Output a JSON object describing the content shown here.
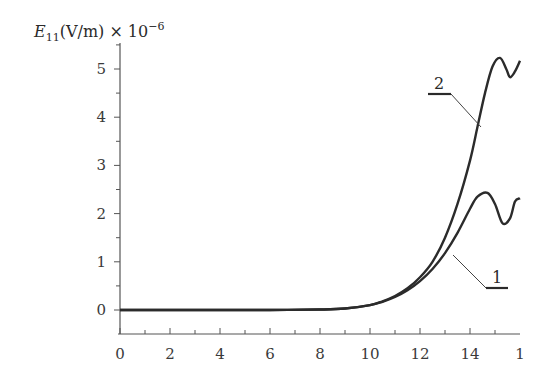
{
  "chart_data": {
    "type": "line",
    "title": "",
    "xlabel": "",
    "ylabel": "E11(V/m) × 10^-6",
    "ylabel_parts": {
      "symbol": "E",
      "subscript": "11",
      "unit": "(V/m) × 10",
      "exponent": "−6"
    },
    "xlim": [
      0,
      16
    ],
    "ylim": [
      0,
      5.5
    ],
    "x_ticks": [
      "0",
      "2",
      "4",
      "6",
      "8",
      "10",
      "12",
      "14",
      "1"
    ],
    "x_tick_values": [
      0,
      2,
      4,
      6,
      8,
      10,
      12,
      14,
      16
    ],
    "y_ticks": [
      "0",
      "1",
      "2",
      "3",
      "4",
      "5"
    ],
    "y_tick_values": [
      0,
      1,
      2,
      3,
      4,
      5
    ],
    "grid": false,
    "legend": "inline labels with leader lines",
    "series": [
      {
        "name": "1",
        "x": [
          0,
          2,
          4,
          6,
          8,
          9,
          10,
          10.5,
          11,
          11.5,
          12,
          12.5,
          13,
          13.5,
          14,
          14.3,
          14.7,
          15.0,
          15.3,
          15.6,
          15.8,
          16.0
        ],
        "values": [
          0,
          0,
          0,
          0,
          0.01,
          0.03,
          0.1,
          0.17,
          0.27,
          0.41,
          0.6,
          0.85,
          1.18,
          1.6,
          2.1,
          2.35,
          2.43,
          2.2,
          1.8,
          1.9,
          2.25,
          2.32
        ]
      },
      {
        "name": "2",
        "x": [
          0,
          2,
          4,
          6,
          8,
          9,
          10,
          10.5,
          11,
          11.5,
          12,
          12.5,
          13,
          13.5,
          14,
          14.3,
          14.6,
          14.9,
          15.2,
          15.45,
          15.6,
          15.8,
          16.0
        ],
        "values": [
          0,
          0,
          0,
          0,
          0.01,
          0.03,
          0.1,
          0.18,
          0.29,
          0.45,
          0.68,
          1.0,
          1.5,
          2.2,
          3.1,
          3.8,
          4.5,
          5.05,
          5.23,
          5.0,
          4.83,
          4.95,
          5.17
        ]
      }
    ],
    "annotations": [
      {
        "text": "2",
        "series": "2"
      },
      {
        "text": "1",
        "series": "1"
      }
    ]
  }
}
